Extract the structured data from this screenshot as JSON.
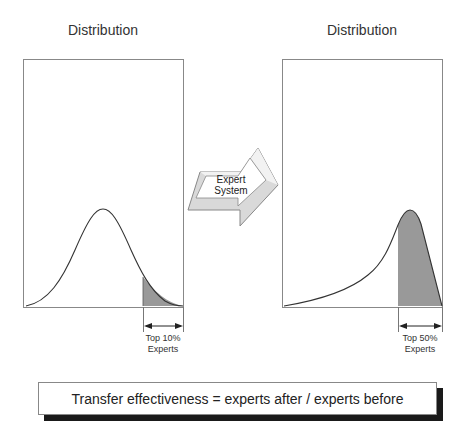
{
  "left_panel": {
    "title": "Distribution",
    "shape": "normal (symmetric bell curve)",
    "highlight_label_line1": "Top 10%",
    "highlight_label_line2": "Experts"
  },
  "right_panel": {
    "title": "Distribution",
    "shape": "left-skewed (peak near right)",
    "highlight_label_line1": "Top 50%",
    "highlight_label_line2": "Experts"
  },
  "arrow": {
    "line1": "Expert",
    "line2": "System"
  },
  "formula": {
    "text": "Transfer effectiveness = experts after / experts before"
  },
  "colors": {
    "frame": "#888888",
    "curve": "#333333",
    "shade": "#999999",
    "arrow_fill": "#d9d9d9",
    "shadow": "#1a1a1a"
  }
}
